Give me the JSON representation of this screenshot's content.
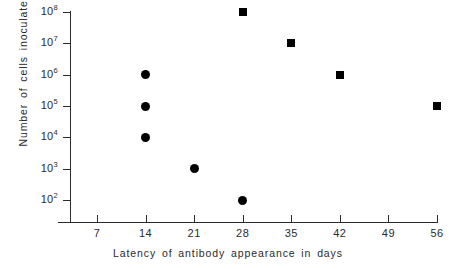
{
  "chart_data": {
    "type": "scatter",
    "title": "",
    "xlabel": "Latency of antibody appearance in days",
    "ylabel": "Number of cells inoculated",
    "yscale": "log",
    "xlim": [
      0,
      59.5
    ],
    "ylim": [
      100,
      100000000
    ],
    "grid": false,
    "legend": "none",
    "xticks": [
      7,
      14,
      21,
      28,
      35,
      42,
      49,
      56
    ],
    "xtick_labels": [
      "7",
      "14",
      "21",
      "28",
      "35",
      "42",
      "49",
      "56"
    ],
    "yticks": [
      100000000,
      10000000,
      1000000,
      100000,
      10000,
      1000,
      100
    ],
    "ytick_labels": [
      {
        "mantissa": "10",
        "exponent": "8"
      },
      {
        "mantissa": "10",
        "exponent": "7"
      },
      {
        "mantissa": "10",
        "exponent": "6"
      },
      {
        "mantissa": "10",
        "exponent": "5"
      },
      {
        "mantissa": "10",
        "exponent": "4"
      },
      {
        "mantissa": "10",
        "exponent": "3"
      },
      {
        "mantissa": "10",
        "exponent": "2"
      }
    ],
    "series": [
      {
        "name": "circles",
        "marker": "circle",
        "color": "#000000",
        "points": [
          {
            "x": 14,
            "y": 1000000
          },
          {
            "x": 14,
            "y": 100000
          },
          {
            "x": 14,
            "y": 10000
          },
          {
            "x": 21,
            "y": 1000
          },
          {
            "x": 28,
            "y": 100
          }
        ]
      },
      {
        "name": "squares",
        "marker": "square",
        "color": "#000000",
        "points": [
          {
            "x": 28,
            "y": 100000000
          },
          {
            "x": 35,
            "y": 10000000
          },
          {
            "x": 42,
            "y": 1000000
          },
          {
            "x": 56,
            "y": 100000
          }
        ]
      }
    ]
  },
  "axes": {
    "line_color": "#2b2b2b"
  }
}
